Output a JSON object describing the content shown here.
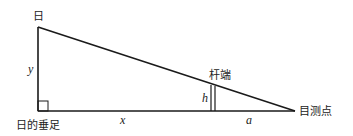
{
  "diagram": {
    "labels": {
      "sun": "日",
      "sun_foot": "日的垂足",
      "pole_top": "杆端",
      "observation_point": "目测点"
    },
    "variables": {
      "height": "y",
      "base_distance": "x",
      "pole_height": "h",
      "pole_to_eye": "a"
    },
    "colors": {
      "stroke": "#1a1a1a",
      "text": "#222222",
      "background": "#ffffff"
    }
  }
}
